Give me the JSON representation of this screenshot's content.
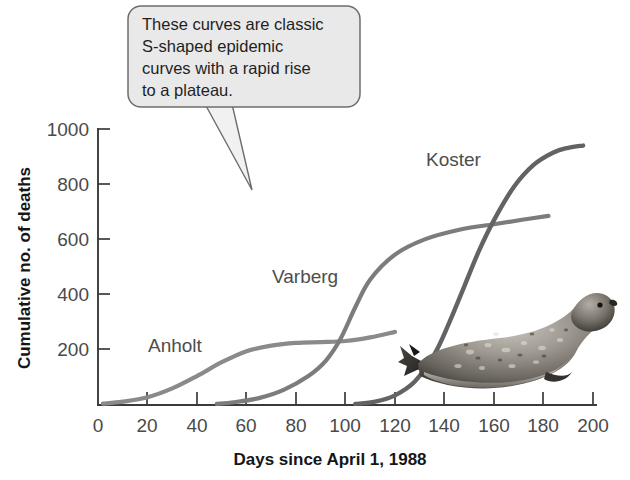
{
  "chart_data": {
    "type": "line",
    "title": "",
    "xlabel": "Days since April 1, 1988",
    "ylabel": "Cumulative no. of deaths",
    "xlim": [
      0,
      200
    ],
    "ylim": [
      0,
      1000
    ],
    "xticks": [
      0,
      20,
      40,
      60,
      80,
      100,
      120,
      140,
      160,
      180,
      200
    ],
    "yticks": [
      0,
      200,
      400,
      600,
      800,
      1000
    ],
    "grid": false,
    "legend_position": "inline-labels",
    "series": [
      {
        "name": "Anholt",
        "color": "#8a8a8a",
        "x": [
          2,
          10,
          20,
          30,
          40,
          50,
          60,
          70,
          80,
          90,
          100,
          110,
          120
        ],
        "y": [
          5,
          12,
          28,
          60,
          105,
          155,
          195,
          215,
          225,
          228,
          232,
          245,
          265
        ]
      },
      {
        "name": "Varberg",
        "color": "#7c7c7c",
        "x": [
          48,
          55,
          65,
          75,
          85,
          92,
          98,
          104,
          110,
          120,
          132,
          146,
          160,
          172,
          182
        ],
        "y": [
          4,
          10,
          25,
          55,
          105,
          160,
          240,
          355,
          455,
          545,
          600,
          635,
          655,
          672,
          685
        ]
      },
      {
        "name": "Koster",
        "color": "#636363",
        "x": [
          104,
          112,
          120,
          128,
          136,
          142,
          148,
          154,
          160,
          168,
          176,
          184,
          190,
          196
        ],
        "y": [
          4,
          12,
          35,
          85,
          185,
          300,
          430,
          560,
          670,
          790,
          870,
          915,
          932,
          940
        ]
      }
    ],
    "annotations": [
      {
        "name": "callout",
        "lines": [
          "These curves are classic",
          "S-shaped epidemic",
          "curves with a rapid rise",
          "to a plateau."
        ],
        "points_to_x": 58,
        "points_to_y": 790
      }
    ],
    "images": [
      {
        "name": "harbor-seal-photo",
        "caption": ""
      }
    ]
  },
  "axes": {
    "y_title": "Cumulative no. of deaths",
    "x_title": "Days since April 1, 1988",
    "y_tick_labels": [
      "0",
      "200",
      "400",
      "600",
      "800",
      "1000"
    ],
    "x_tick_labels": [
      "0",
      "20",
      "40",
      "60",
      "80",
      "100",
      "120",
      "140",
      "160",
      "180",
      "200"
    ]
  },
  "series_labels": {
    "anholt": "Anholt",
    "varberg": "Varberg",
    "koster": "Koster"
  },
  "callout": {
    "line1": "These curves are classic",
    "line2": "S-shaped epidemic",
    "line3": "curves with a rapid rise",
    "line4": "to a plateau."
  },
  "colors": {
    "anholt": "#8a8a8a",
    "varberg": "#7c7c7c",
    "koster": "#636363",
    "axis": "#3a3a3a",
    "callout_fill": "#e9e9e9",
    "callout_border": "#6d6d6d"
  }
}
